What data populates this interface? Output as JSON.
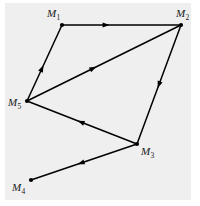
{
  "figure": {
    "type": "directed-graph-diagram",
    "background_color": "#ffffff",
    "panel_color": "#efefef",
    "ink_color": "#000000",
    "width": 200,
    "height": 206
  },
  "nodes": [
    {
      "id": "M1",
      "label": "M",
      "subscript": "1",
      "x": 62,
      "y": 25,
      "label_x": 47,
      "label_y": 8,
      "dot": true
    },
    {
      "id": "M2",
      "label": "M",
      "subscript": "2",
      "x": 181,
      "y": 25,
      "label_x": 176,
      "label_y": 8,
      "dot": true
    },
    {
      "id": "M5",
      "label": "M",
      "subscript": "5",
      "x": 27,
      "y": 101,
      "label_x": 8,
      "label_y": 97,
      "dot": true
    },
    {
      "id": "M3",
      "label": "M",
      "subscript": "3",
      "x": 137,
      "y": 144,
      "label_x": 141,
      "label_y": 146,
      "dot": true
    },
    {
      "id": "M4",
      "label": "M",
      "subscript": "4",
      "x": 31,
      "y": 180,
      "label_x": 12,
      "label_y": 182,
      "dot": true
    }
  ],
  "edges": [
    {
      "id": "e1",
      "from": "M1",
      "to": "M2",
      "arrow_t": 0.4,
      "directed": true
    },
    {
      "id": "e2",
      "from": "M5",
      "to": "M1",
      "arrow_t": 0.47,
      "directed": true
    },
    {
      "id": "e3",
      "from": "M5",
      "to": "M2",
      "arrow_t": 0.45,
      "directed": true
    },
    {
      "id": "e4",
      "from": "M2",
      "to": "M3",
      "arrow_t": 0.53,
      "directed": true
    },
    {
      "id": "e5",
      "from": "M3",
      "to": "M5",
      "arrow_t": 0.54,
      "directed": true
    },
    {
      "id": "e6",
      "from": "M3",
      "to": "M4",
      "arrow_t": 0.56,
      "directed": true
    }
  ],
  "style": {
    "edge_width": 1.5,
    "node_radius": 2.1,
    "arrow_length": 7,
    "arrow_half_width": 2.6
  }
}
